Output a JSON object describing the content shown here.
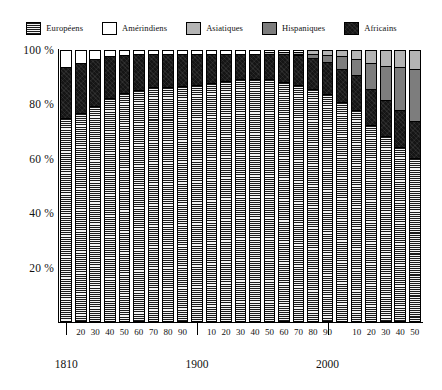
{
  "legend": {
    "items": [
      {
        "label": "Européens",
        "key": "europeens",
        "fill": "fill-europeens",
        "color": "#1a1a1a"
      },
      {
        "label": "Amérindiens",
        "key": "amerindiens",
        "fill": "fill-amerindiens",
        "color": "#ffffff"
      },
      {
        "label": "Asiatiques",
        "key": "asiatiques",
        "fill": "fill-asiatiques",
        "color": "#b4b4b4"
      },
      {
        "label": "Hispaniques",
        "key": "hispaniques",
        "fill": "fill-hispaniques",
        "color": "#7d7d7d"
      },
      {
        "label": "Africains",
        "key": "africains",
        "fill": "fill-africains",
        "color": "#151515"
      }
    ]
  },
  "chart_data": {
    "type": "bar",
    "title": "",
    "subtitle": "",
    "xlabel": "",
    "ylabel": "",
    "stacked": true,
    "normalized_percent": true,
    "grid": false,
    "legend_position": "top",
    "ylim": [
      0,
      100
    ],
    "ytick_labels": [
      "20 %",
      "40 %",
      "60 %",
      "80 %",
      "100 %"
    ],
    "ytick_values": [
      20,
      40,
      60,
      80,
      100
    ],
    "categories": [
      "1810",
      "1820",
      "1830",
      "1840",
      "1850",
      "1860",
      "1870",
      "1880",
      "1890",
      "1900",
      "1910",
      "1920",
      "1930",
      "1940",
      "1950",
      "1960",
      "1970",
      "1980",
      "1990",
      "2000",
      "2010",
      "2020",
      "2030",
      "2040",
      "2050"
    ],
    "xtick_labels": [
      "",
      "20",
      "30",
      "40",
      "50",
      "60",
      "70",
      "80",
      "90",
      "",
      "10",
      "20",
      "30",
      "40",
      "50",
      "60",
      "70",
      "80",
      "90",
      "",
      "10",
      "20",
      "30",
      "40",
      "50"
    ],
    "major_ticks": [
      {
        "label": "1810",
        "index": 0
      },
      {
        "label": "1900",
        "index": 9
      },
      {
        "label": "2000",
        "index": 18
      }
    ],
    "series": [
      {
        "name": "Européens",
        "key": "europeens",
        "values": [
          75.0,
          77.0,
          79.5,
          82.5,
          84.5,
          85.5,
          86.5,
          86.5,
          87.0,
          87.5,
          88.0,
          89.0,
          89.5,
          89.5,
          89.5,
          88.5,
          87.5,
          86.0,
          84.0,
          81.0,
          78.0,
          72.5,
          68.5,
          64.5,
          60.5
        ]
      },
      {
        "name": "Africains",
        "key": "africains",
        "values": [
          19.0,
          18.5,
          17.5,
          15.5,
          14.0,
          13.5,
          12.5,
          12.5,
          12.0,
          11.5,
          11.0,
          10.0,
          9.5,
          9.5,
          9.5,
          10.5,
          11.0,
          11.5,
          12.0,
          12.5,
          13.0,
          13.5,
          13.5,
          13.5,
          13.5
        ]
      },
      {
        "name": "Hispaniques",
        "key": "hispaniques",
        "values": [
          0,
          0,
          0,
          0,
          0,
          0,
          0,
          0,
          0,
          0,
          0,
          0,
          0,
          0,
          0,
          0,
          0.5,
          1.5,
          2.5,
          4.5,
          6.0,
          9.5,
          12.5,
          16.0,
          19.5
        ]
      },
      {
        "name": "Asiatiques",
        "key": "asiatiques",
        "values": [
          0,
          0,
          0,
          0,
          0,
          0,
          0,
          0,
          0,
          0,
          0,
          0,
          0,
          0,
          0.5,
          0.5,
          0.7,
          1.0,
          1.5,
          2.0,
          3.0,
          4.5,
          5.5,
          6.0,
          6.5
        ]
      },
      {
        "name": "Amérindiens",
        "key": "amerindiens",
        "values": [
          6.0,
          4.5,
          3.0,
          2.0,
          1.5,
          1.0,
          1.0,
          1.0,
          1.0,
          1.0,
          1.0,
          1.0,
          1.0,
          1.0,
          0.5,
          0.5,
          0.3,
          0.0,
          0.0,
          0.0,
          0.0,
          0.0,
          0.0,
          0.0,
          0.0
        ]
      }
    ],
    "stack_order_bottom_to_top": [
      "europeens",
      "africains",
      "hispaniques",
      "asiatiques",
      "amerindiens"
    ]
  }
}
